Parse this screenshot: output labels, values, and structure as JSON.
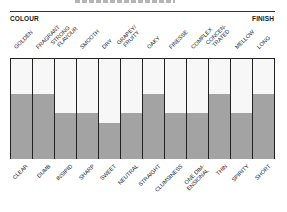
{
  "header": {
    "left_label": "COLOUR",
    "right_label": "FINISH"
  },
  "top_labels": [
    {
      "line1": "GOLDEN",
      "line2": ""
    },
    {
      "line1": "FRAGRANT",
      "line2": ""
    },
    {
      "line1": "STRONG",
      "line2": "FLAVOUR"
    },
    {
      "line1": "SMOOTH",
      "line2": ""
    },
    {
      "line1": "DRY",
      "line2": ""
    },
    {
      "line1": "GRAPEY/",
      "line2": "FRUITY"
    },
    {
      "line1": "OAKY",
      "line2": ""
    },
    {
      "line1": "FINESSE",
      "line2": ""
    },
    {
      "line1": "COMPLEX",
      "line2": ""
    },
    {
      "line1": "CONCEN-",
      "line2": "TRATED"
    },
    {
      "line1": "MELLOW",
      "line2": ""
    },
    {
      "line1": "LONG",
      "line2": ""
    }
  ],
  "bottom_labels": [
    {
      "line1": "CLEAR",
      "line2": ""
    },
    {
      "line1": "DUMB",
      "line2": ""
    },
    {
      "line1": "INSIPID",
      "line2": ""
    },
    {
      "line1": "SHARP",
      "line2": ""
    },
    {
      "line1": "SWEET",
      "line2": ""
    },
    {
      "line1": "NEUTRAL",
      "line2": ""
    },
    {
      "line1": "STRAIGHT",
      "line2": ""
    },
    {
      "line1": "CLUMSINESS",
      "line2": ""
    },
    {
      "line1": "ONE DIM-",
      "line2": "ENSIONAL"
    },
    {
      "line1": "THIN",
      "line2": ""
    },
    {
      "line1": "SPIRITY",
      "line2": ""
    },
    {
      "line1": "SHORT",
      "line2": ""
    }
  ],
  "colors": {
    "fill": "#a3a3a3",
    "empty": "#f7f7f7",
    "grid": "#222222"
  },
  "chart_data": {
    "type": "bar",
    "title": "",
    "xlabel": "",
    "ylabel": "",
    "left_axis_label": "COLOUR",
    "right_axis_label": "FINISH",
    "categories": [
      "GOLDEN / CLEAR",
      "FRAGRANT / DUMB",
      "STRONG FLAVOUR / INSIPID",
      "SMOOTH / SHARP",
      "DRY / SWEET",
      "GRAPEY/FRUITY / NEUTRAL",
      "OAKY / STRAIGHT",
      "FINESSE / CLUMSINESS",
      "COMPLEX / ONE DIMENSIONAL",
      "CONCENTRATED / THIN",
      "MELLOW / SPIRITY",
      "LONG / SHORT"
    ],
    "top_pole": [
      "GOLDEN",
      "FRAGRANT",
      "STRONG FLAVOUR",
      "SMOOTH",
      "DRY",
      "GRAPEY/FRUITY",
      "OAKY",
      "FINESSE",
      "COMPLEX",
      "CONCENTRATED",
      "MELLOW",
      "LONG"
    ],
    "bottom_pole": [
      "CLEAR",
      "DUMB",
      "INSIPID",
      "SHARP",
      "SWEET",
      "NEUTRAL",
      "STRAIGHT",
      "CLUMSINESS",
      "ONE DIMENSIONAL",
      "THIN",
      "SPIRITY",
      "SHORT"
    ],
    "values": [
      0.65,
      0.65,
      0.46,
      0.46,
      0.36,
      0.46,
      0.65,
      0.46,
      0.46,
      0.65,
      0.46,
      0.65
    ],
    "ylim": [
      0,
      1
    ],
    "grid": false,
    "legend": null
  }
}
